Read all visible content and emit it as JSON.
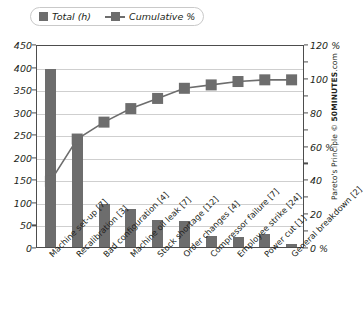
{
  "legend": {
    "items": [
      {
        "label": "Total (h)",
        "marker": "square-swatch",
        "color": "#6d6d6d"
      },
      {
        "label": "Cumulative %",
        "marker": "line-with-square-marker",
        "color": "#6d6d6d"
      }
    ]
  },
  "attribution": {
    "prefix": "Pareto's Principle  ©  ",
    "brand": "50MINUTES",
    "suffix": ".com",
    "full": "Pareto's Principle © 50MINUTES.com"
  },
  "axes": {
    "left": {
      "ticks": [
        "450",
        "400",
        "350",
        "300",
        "250",
        "200",
        "150",
        "100",
        "50",
        "0"
      ],
      "values": [
        450,
        400,
        350,
        300,
        250,
        200,
        150,
        100,
        50,
        0
      ],
      "min": 0,
      "max": 450
    },
    "right": {
      "ticks": [
        "120 %",
        "100",
        "80",
        "60 %",
        "40",
        "20",
        "0 %"
      ],
      "values": [
        120,
        100,
        80,
        60,
        40,
        20,
        0
      ],
      "min": 0,
      "max": 120
    }
  },
  "chart_data": {
    "type": "bar",
    "title": "",
    "subtitle": "",
    "xlabel": "",
    "ylabel": "",
    "y2label": "",
    "grid": true,
    "legend_position": "top-left",
    "ylim": [
      0,
      450
    ],
    "y2lim": [
      0,
      120
    ],
    "categories": [
      "Machine set-up [7]",
      "Recalibration [3]",
      "Bad configuration [4]",
      "Machine oil leak [7]",
      "Stock shortage [12]",
      "Order changes [4]",
      "Compressor failure [7]",
      "Employee strike [24]",
      "Power cut [1]",
      "General breakdown [2]"
    ],
    "series": [
      {
        "name": "Total (h)",
        "type": "bar",
        "axis": "left",
        "color": "#6d6d6d",
        "values": [
          395,
          245,
          95,
          85,
          60,
          58,
          25,
          22,
          28,
          7
        ]
      },
      {
        "name": "Cumulative %",
        "type": "line",
        "axis": "right",
        "color": "#6d6d6d",
        "values": [
          40,
          65,
          75,
          83,
          89,
          95,
          97,
          99,
          100,
          100
        ]
      }
    ]
  }
}
